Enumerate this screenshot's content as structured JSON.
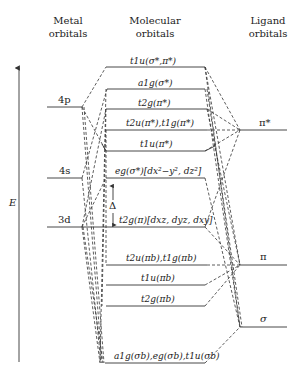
{
  "headers": {
    "metal": "Metal orbitals",
    "metal_l1": "Metal",
    "metal_l2": "orbitals",
    "mo_l1": "Molecular",
    "mo_l2": "orbitals",
    "lig_l1": "Ligand",
    "lig_l2": "orbitals"
  },
  "axis": {
    "label": "E"
  },
  "metal_levels": [
    {
      "label": "4p",
      "y": 107
    },
    {
      "label": "4s",
      "y": 178
    },
    {
      "label": "3d",
      "y": 227
    }
  ],
  "ligand_levels": [
    {
      "label": "π*",
      "y": 130
    },
    {
      "label": "π",
      "y": 265
    },
    {
      "label": "σ",
      "y": 327
    }
  ],
  "mo_levels": [
    {
      "label": "t1u(σ*,π*)",
      "y": 67
    },
    {
      "label": "a1g(σ*)",
      "y": 89
    },
    {
      "label": "t2g(π*)",
      "y": 109
    },
    {
      "label": "t2u(π*),t1g(π*)",
      "y": 130
    },
    {
      "label": "t1u(π*)",
      "y": 151
    },
    {
      "label": "eg(σ*)[dx²−y², dz²]",
      "y": 178
    },
    {
      "label": "t2g(π)[dxz, dyz, dxy]",
      "y": 227
    },
    {
      "label": "t2u(πb),t1g(πb)",
      "y": 265
    },
    {
      "label": "t1u(πb)",
      "y": 285
    },
    {
      "label": "t2g(πb)",
      "y": 306
    },
    {
      "label": "a1g(σb),eg(σb),t1u(σb)",
      "y": 363
    }
  ],
  "gap": {
    "label": "Δ"
  }
}
